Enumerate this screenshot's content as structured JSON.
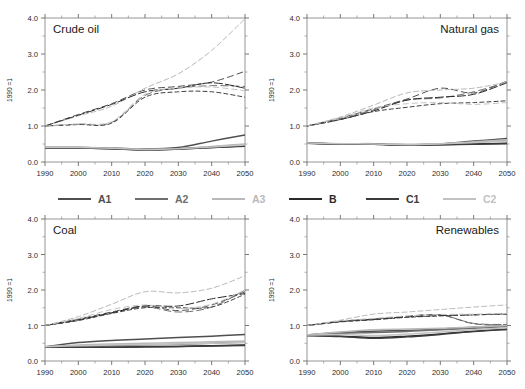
{
  "figure": {
    "ylabel": "1990 =1",
    "yticks": [
      "0.0",
      "1.0",
      "2.0",
      "3.0",
      "4.0"
    ],
    "xticks": [
      "1990",
      "2000",
      "2010",
      "2020",
      "2030",
      "2040",
      "2050"
    ]
  },
  "legend": {
    "position": "center-between-rows",
    "items": [
      {
        "label": "A1",
        "color": "#4f4f4f",
        "dash": "none"
      },
      {
        "label": "A2",
        "color": "#6e6e6e",
        "dash": "none"
      },
      {
        "label": "A3",
        "color": "#b9b9b9",
        "dash": "none"
      },
      {
        "label": "B",
        "color": "#2a2a2a",
        "dash": "none"
      },
      {
        "label": "C1",
        "color": "#3c3c3c",
        "dash": "none"
      },
      {
        "label": "C2",
        "color": "#c2c2c2",
        "dash": "none"
      }
    ]
  },
  "chart_data": [
    {
      "type": "line",
      "title": "Crude oil",
      "panel": "top-left",
      "xlabel": "",
      "ylabel": "1990 =1",
      "xlim": [
        1990,
        2050
      ],
      "ylim": [
        0,
        4
      ],
      "grid": false,
      "x": [
        1990,
        2000,
        2010,
        2020,
        2030,
        2040,
        2050
      ],
      "series": [
        {
          "name": "A1",
          "color": "#4f4f4f",
          "dash": "6,4",
          "values": [
            1.0,
            1.32,
            1.62,
            2.0,
            2.1,
            2.22,
            2.52
          ]
        },
        {
          "name": "A2",
          "color": "#6e6e6e",
          "dash": "7,4",
          "values": [
            1.0,
            1.05,
            1.1,
            1.85,
            2.05,
            2.12,
            2.1
          ]
        },
        {
          "name": "A3",
          "color": "#b9b9b9",
          "dash": "5,3",
          "values": [
            1.0,
            1.28,
            1.55,
            2.05,
            2.45,
            3.1,
            3.98
          ]
        },
        {
          "name": "B",
          "color": "#2a2a2a",
          "dash": "8,3",
          "values": [
            1.0,
            1.3,
            1.6,
            1.95,
            2.05,
            2.2,
            2.05
          ]
        },
        {
          "name": "C1",
          "color": "#3c3c3c",
          "dash": "4,3",
          "values": [
            1.0,
            1.04,
            1.08,
            1.8,
            1.95,
            1.95,
            1.8
          ]
        },
        {
          "name": "C2",
          "color": "#c2c2c2",
          "dash": "5,4",
          "values": [
            1.0,
            1.06,
            1.12,
            1.88,
            2.05,
            2.08,
            1.98
          ]
        },
        {
          "name": "A1-low",
          "color": "#4f4f4f",
          "dash": "none",
          "values": [
            0.4,
            0.4,
            0.39,
            0.36,
            0.4,
            0.58,
            0.75
          ]
        },
        {
          "name": "A2-low",
          "color": "#6e6e6e",
          "dash": "none",
          "values": [
            0.4,
            0.4,
            0.38,
            0.35,
            0.37,
            0.42,
            0.48
          ]
        },
        {
          "name": "A3-low",
          "color": "#b9b9b9",
          "dash": "none",
          "values": [
            0.4,
            0.4,
            0.38,
            0.35,
            0.37,
            0.43,
            0.5
          ]
        },
        {
          "name": "B-low",
          "color": "#2a2a2a",
          "dash": "none",
          "values": [
            0.39,
            0.39,
            0.37,
            0.34,
            0.36,
            0.4,
            0.45
          ]
        },
        {
          "name": "C1-low",
          "color": "#3c3c3c",
          "dash": "none",
          "values": [
            0.39,
            0.39,
            0.37,
            0.34,
            0.36,
            0.4,
            0.44
          ]
        },
        {
          "name": "C2-low",
          "color": "#c2c2c2",
          "dash": "none",
          "values": [
            0.4,
            0.4,
            0.38,
            0.35,
            0.37,
            0.42,
            0.47
          ]
        }
      ]
    },
    {
      "type": "line",
      "title": "Natural gas",
      "panel": "top-right",
      "xlabel": "",
      "ylabel": "1990 =1",
      "xlim": [
        1990,
        2050
      ],
      "ylim": [
        0,
        4
      ],
      "grid": false,
      "x": [
        1990,
        2000,
        2010,
        2020,
        2030,
        2040,
        2050
      ],
      "series": [
        {
          "name": "A1",
          "color": "#4f4f4f",
          "dash": "6,4",
          "values": [
            1.0,
            1.22,
            1.48,
            1.75,
            2.05,
            1.92,
            2.25
          ]
        },
        {
          "name": "A2",
          "color": "#6e6e6e",
          "dash": "7,4",
          "values": [
            1.0,
            1.2,
            1.45,
            1.72,
            1.78,
            1.95,
            2.22
          ]
        },
        {
          "name": "A3",
          "color": "#b9b9b9",
          "dash": "5,3",
          "values": [
            1.0,
            1.25,
            1.58,
            1.92,
            2.0,
            2.05,
            2.22
          ]
        },
        {
          "name": "B",
          "color": "#2a2a2a",
          "dash": "8,3",
          "values": [
            1.0,
            1.18,
            1.42,
            1.72,
            1.8,
            1.88,
            2.2
          ]
        },
        {
          "name": "C1",
          "color": "#3c3c3c",
          "dash": "4,3",
          "values": [
            1.0,
            1.18,
            1.4,
            1.52,
            1.62,
            1.65,
            1.7
          ]
        },
        {
          "name": "C2",
          "color": "#c2c2c2",
          "dash": "5,4",
          "values": [
            1.0,
            1.22,
            1.5,
            1.62,
            1.65,
            1.6,
            1.65
          ]
        },
        {
          "name": "A1-low",
          "color": "#4f4f4f",
          "dash": "none",
          "values": [
            0.53,
            0.5,
            0.5,
            0.48,
            0.5,
            0.58,
            0.65
          ]
        },
        {
          "name": "A2-low",
          "color": "#6e6e6e",
          "dash": "none",
          "values": [
            0.53,
            0.5,
            0.5,
            0.48,
            0.5,
            0.55,
            0.6
          ]
        },
        {
          "name": "A3-low",
          "color": "#b9b9b9",
          "dash": "none",
          "values": [
            0.53,
            0.51,
            0.51,
            0.49,
            0.51,
            0.56,
            0.62
          ]
        },
        {
          "name": "B-low",
          "color": "#2a2a2a",
          "dash": "none",
          "values": [
            0.52,
            0.5,
            0.49,
            0.47,
            0.48,
            0.5,
            0.52
          ]
        },
        {
          "name": "C1-low",
          "color": "#3c3c3c",
          "dash": "none",
          "values": [
            0.52,
            0.5,
            0.49,
            0.47,
            0.48,
            0.49,
            0.51
          ]
        },
        {
          "name": "C2-low",
          "color": "#c2c2c2",
          "dash": "none",
          "values": [
            0.53,
            0.51,
            0.5,
            0.48,
            0.5,
            0.54,
            0.58
          ]
        }
      ]
    },
    {
      "type": "line",
      "title": "Coal",
      "panel": "bottom-left",
      "xlabel": "",
      "ylabel": "1990 =1",
      "xlim": [
        1990,
        2050
      ],
      "ylim": [
        0,
        4
      ],
      "grid": false,
      "x": [
        1990,
        2000,
        2010,
        2020,
        2030,
        2040,
        2050
      ],
      "series": [
        {
          "name": "A1",
          "color": "#4f4f4f",
          "dash": "6,4",
          "values": [
            1.0,
            1.18,
            1.38,
            1.55,
            1.42,
            1.58,
            1.95
          ]
        },
        {
          "name": "A2",
          "color": "#6e6e6e",
          "dash": "7,4",
          "values": [
            1.0,
            1.15,
            1.35,
            1.52,
            1.38,
            1.52,
            2.0
          ]
        },
        {
          "name": "A3",
          "color": "#b9b9b9",
          "dash": "5,3",
          "values": [
            1.0,
            1.25,
            1.6,
            1.95,
            1.92,
            2.05,
            2.4
          ]
        },
        {
          "name": "B",
          "color": "#2a2a2a",
          "dash": "8,3",
          "values": [
            1.0,
            1.16,
            1.36,
            1.55,
            1.55,
            1.75,
            1.9
          ]
        },
        {
          "name": "C1",
          "color": "#3c3c3c",
          "dash": "4,3",
          "values": [
            1.0,
            1.14,
            1.34,
            1.5,
            1.5,
            1.52,
            1.88
          ]
        },
        {
          "name": "C2",
          "color": "#c2c2c2",
          "dash": "5,4",
          "values": [
            1.0,
            1.2,
            1.45,
            1.58,
            1.48,
            1.6,
            2.0
          ]
        },
        {
          "name": "A1-low",
          "color": "#4f4f4f",
          "dash": "none",
          "values": [
            0.4,
            0.52,
            0.58,
            0.62,
            0.66,
            0.7,
            0.75
          ]
        },
        {
          "name": "A2-low",
          "color": "#6e6e6e",
          "dash": "none",
          "values": [
            0.4,
            0.42,
            0.44,
            0.45,
            0.47,
            0.5,
            0.53
          ]
        },
        {
          "name": "A3-low",
          "color": "#b9b9b9",
          "dash": "none",
          "values": [
            0.4,
            0.45,
            0.48,
            0.5,
            0.52,
            0.54,
            0.56
          ]
        },
        {
          "name": "B-low",
          "color": "#2a2a2a",
          "dash": "none",
          "values": [
            0.39,
            0.39,
            0.39,
            0.4,
            0.41,
            0.43,
            0.45
          ]
        },
        {
          "name": "C1-low",
          "color": "#3c3c3c",
          "dash": "none",
          "values": [
            0.39,
            0.39,
            0.39,
            0.4,
            0.41,
            0.42,
            0.44
          ]
        },
        {
          "name": "C2-low",
          "color": "#c2c2c2",
          "dash": "none",
          "values": [
            0.4,
            0.43,
            0.45,
            0.46,
            0.48,
            0.5,
            0.52
          ]
        }
      ]
    },
    {
      "type": "line",
      "title": "Renewables",
      "panel": "bottom-right",
      "xlabel": "",
      "ylabel": "1990 =1",
      "xlim": [
        1990,
        2050
      ],
      "ylim": [
        0,
        4
      ],
      "grid": false,
      "x": [
        1990,
        2000,
        2010,
        2020,
        2030,
        2040,
        2050
      ],
      "series": [
        {
          "name": "A1",
          "color": "#4f4f4f",
          "dash": "6,4",
          "values": [
            1.0,
            1.12,
            1.18,
            1.26,
            1.3,
            1.05,
            1.02
          ]
        },
        {
          "name": "A2",
          "color": "#6e6e6e",
          "dash": "7,4",
          "values": [
            1.0,
            1.12,
            1.18,
            1.25,
            1.3,
            1.06,
            1.03
          ]
        },
        {
          "name": "A3",
          "color": "#b9b9b9",
          "dash": "5,3",
          "values": [
            1.0,
            1.15,
            1.32,
            1.38,
            1.45,
            1.52,
            1.58
          ]
        },
        {
          "name": "B",
          "color": "#2a2a2a",
          "dash": "8,3",
          "values": [
            1.0,
            1.11,
            1.17,
            1.24,
            1.28,
            1.3,
            1.33
          ]
        },
        {
          "name": "C1",
          "color": "#3c3c3c",
          "dash": "4,3",
          "values": [
            1.0,
            1.1,
            1.16,
            1.23,
            1.27,
            1.3,
            1.32
          ]
        },
        {
          "name": "C2",
          "color": "#c2c2c2",
          "dash": "5,4",
          "values": [
            1.0,
            1.13,
            1.2,
            1.27,
            1.31,
            1.32,
            1.34
          ]
        },
        {
          "name": "A1-low",
          "color": "#4f4f4f",
          "dash": "none",
          "values": [
            0.73,
            0.8,
            0.84,
            0.86,
            0.9,
            0.95,
            1.0
          ]
        },
        {
          "name": "A2-low",
          "color": "#6e6e6e",
          "dash": "none",
          "values": [
            0.73,
            0.78,
            0.8,
            0.83,
            0.88,
            0.92,
            0.97
          ]
        },
        {
          "name": "A3-low",
          "color": "#b9b9b9",
          "dash": "none",
          "values": [
            0.74,
            0.82,
            0.88,
            0.9,
            0.92,
            0.96,
            1.0
          ]
        },
        {
          "name": "B-low",
          "color": "#2a2a2a",
          "dash": "none",
          "values": [
            0.72,
            0.7,
            0.66,
            0.7,
            0.76,
            0.84,
            0.9
          ]
        },
        {
          "name": "C1-low",
          "color": "#3c3c3c",
          "dash": "none",
          "values": [
            0.72,
            0.69,
            0.64,
            0.68,
            0.75,
            0.83,
            0.89
          ]
        },
        {
          "name": "C2-low",
          "color": "#c2c2c2",
          "dash": "none",
          "values": [
            0.73,
            0.75,
            0.72,
            0.76,
            0.82,
            0.88,
            0.94
          ]
        }
      ]
    }
  ]
}
